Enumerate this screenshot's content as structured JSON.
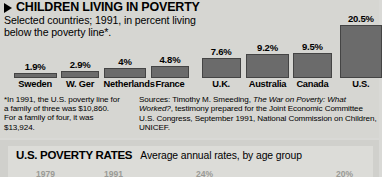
{
  "top_panel": {
    "headline": "CHILDREN LIVING IN POVERTY",
    "bullet_icon": "triangle-right-icon",
    "subtitle": "Selected countries; 1991, in percent living below the poverty line*.",
    "footnote": "*In 1991, the U.S. poverty line for a family of three was $10,860. For a family of four, it was $13,924.",
    "sources_label": "Sources:",
    "sources_part1": "  Timothy M. Smeeding, ",
    "sources_italic1": "The War on Poverty: What Worked?",
    "sources_part2": ", testimony prepared for the Joint Economic Committee U.S. Congress, September 1991, National Commission on Children, UNICEF."
  },
  "bottom_panel": {
    "title": "U.S. POVERTY RATES",
    "subtitle": "Average annual rates, by age group",
    "clipped_labels": [
      "1979",
      "1991",
      "24%",
      "20%"
    ]
  },
  "colors": {
    "bar_fill": "#6b6b6b",
    "bar_stroke": "#444444",
    "panel_background": "#d6d6d2",
    "page_background": "#d9d9d6"
  },
  "chart_data": {
    "type": "bar",
    "title": "CHILDREN LIVING IN POVERTY",
    "subtitle": "Selected countries; 1991, in percent living below the poverty line*.",
    "xlabel": "",
    "ylabel": "Percent of children living below the poverty line",
    "ylim": [
      0,
      20.5
    ],
    "grid": false,
    "legend": "none",
    "categories": [
      "Sweden",
      "W. Ger",
      "Netherlands",
      "France",
      "U.K.",
      "Australia",
      "Canada",
      "U.S."
    ],
    "values": [
      1.9,
      2.9,
      4,
      4.8,
      7.6,
      9.2,
      9.5,
      20.5
    ],
    "value_labels": [
      "1.9%",
      "2.9%",
      "4%",
      "4.8%",
      "7.6%",
      "9.2%",
      "9.5%",
      "20.5%"
    ]
  }
}
